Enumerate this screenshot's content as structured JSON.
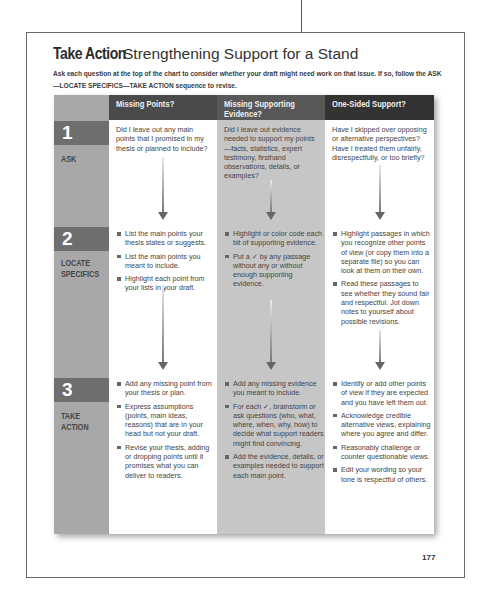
{
  "title": {
    "main": "Take Action",
    "subtitle": "Strengthening Support for a Stand"
  },
  "intro": "Ask each question at the top of the chart to consider whether your draft might need work on that issue. If so, follow the ASK—LOCATE SPECIFICS—TAKE ACTION sequence to revise.",
  "columns": [
    {
      "header": "Missing Points?"
    },
    {
      "header": "Missing Supporting Evidence?"
    },
    {
      "header": "One-Sided Support?"
    }
  ],
  "steps": [
    {
      "number": "1",
      "label": "ASK"
    },
    {
      "number": "2",
      "label_line1": "LOCATE",
      "label_line2": "SPECIFICS"
    },
    {
      "number": "3",
      "label_line1": "TAKE",
      "label_line2": "ACTION"
    }
  ],
  "ask": [
    "Did I leave out any main points that I promised in my thesis or planned to include?",
    "Did I leave out evidence needed to support my points—facts, statistics, expert testimony, firsthand observations, details, or examples?",
    "Have I skipped over opposing or alternative perspectives? Have I treated them unfairly, disrespectfully, or too briefly?"
  ],
  "locate": [
    [
      "List the main points your thesis states or suggests.",
      "List the main points you meant to include.",
      "Highlight each point from your lists in your draft."
    ],
    [
      "Highlight or color code each bit of supporting evidence.",
      "Put a ✓ by any passage without any or without enough supporting evidence."
    ],
    [
      "Highlight passages in which you recognize other points of view (or copy them into a separate file) so you can look at them on their own.",
      "Read these passages to see whether they sound fair and respectful. Jot down notes to yourself about possible revisions."
    ]
  ],
  "action": [
    [
      "Add any missing point from your thesis or plan.",
      "Express assumptions (points, main ideas, reasons) that are in your head but not your draft.",
      "Revise your thesis, adding or dropping points until it promises what you can deliver to readers."
    ],
    [
      "Add any missing evidence you meant to include.",
      "For each ✓, brainstorm or ask questions (who, what, where, when, why, how) to decide what support readers might find convincing.",
      "Add the evidence, details, or examples needed to support each main point."
    ],
    [
      "Identify or add other points of view if they are expected and you have left them out.",
      "Acknowledge credible alternative views, explaining where you agree and differ.",
      "Reasonably challenge or counter questionable views.",
      "Edit your wording so your tone is respectful of others."
    ]
  ],
  "page_number": "177"
}
